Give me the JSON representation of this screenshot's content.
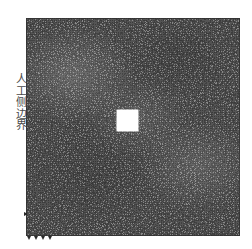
{
  "figure": {
    "type": "fem-mesh-diagram",
    "background_color": "#ffffff",
    "width": 252,
    "height": 249
  },
  "labels": {
    "artificial_lateral_boundary": "人工侧边界"
  },
  "mesh": {
    "domain_color": "#8a8a8a",
    "edge_color": "#3a3a3a",
    "region": {
      "x": 26,
      "y": 18,
      "width": 214,
      "height": 218
    },
    "density": "very-fine-unstructured"
  },
  "excavation": {
    "shape": "square",
    "fill_color": "#ffffff",
    "region": {
      "x": 117,
      "y": 110,
      "width": 21,
      "height": 21
    }
  },
  "supports": {
    "markers": [
      {
        "name": "support-left-roller",
        "x": 24,
        "y": 212,
        "orientation": "left"
      },
      {
        "name": "support-bottom-corner",
        "x": 27,
        "y": 236,
        "orientation": "bottom"
      },
      {
        "name": "support-bottom-1",
        "x": 34,
        "y": 236,
        "orientation": "bottom"
      },
      {
        "name": "support-bottom-2",
        "x": 41,
        "y": 236,
        "orientation": "bottom"
      },
      {
        "name": "support-bottom-3",
        "x": 48,
        "y": 236,
        "orientation": "bottom"
      }
    ]
  }
}
